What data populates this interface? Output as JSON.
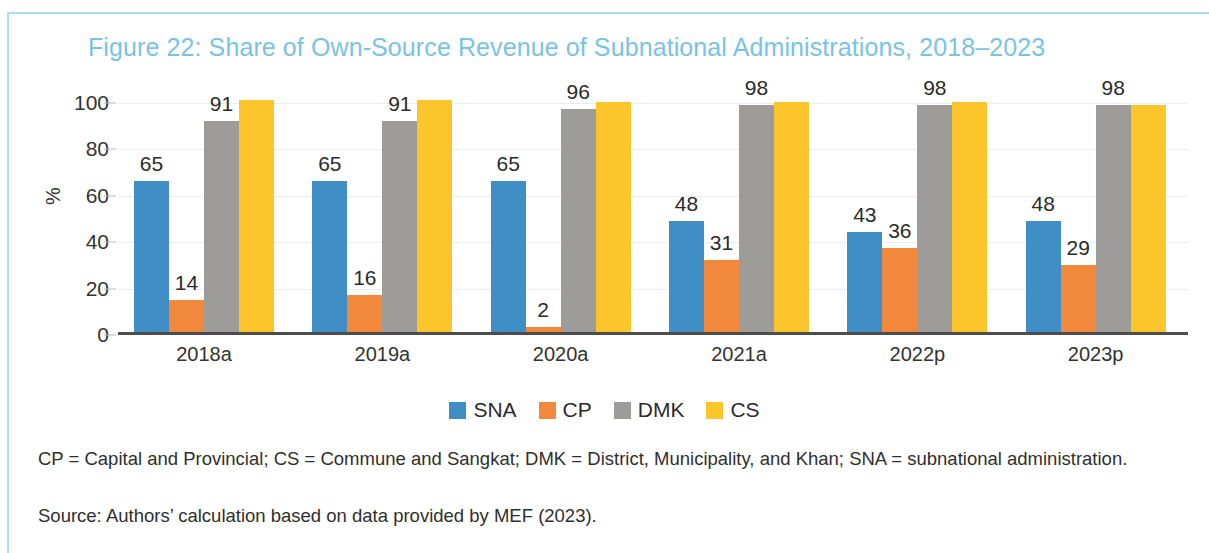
{
  "figure": {
    "title": "Figure 22: Share of Own-Source Revenue of Subnational Administrations, 2018–2023",
    "title_color": "#78c3e6",
    "notes": "CP = Capital and Provincial; CS = Commune and Sangkat; DMK = District, Municipality, and Khan; SNA = subnational administration.",
    "source": "Source: Authors’ calculation based on data provided by MEF (2023)."
  },
  "chart_data": {
    "type": "bar",
    "title": "Figure 22: Share of Own-Source Revenue of Subnational Administrations, 2018–2023",
    "xlabel": "",
    "ylabel": "%",
    "ylim": [
      0,
      100
    ],
    "yticks": [
      0,
      20,
      40,
      60,
      80,
      100
    ],
    "grid": true,
    "legend_position": "bottom",
    "categories": [
      "2018a",
      "2019a",
      "2020a",
      "2021a",
      "2022p",
      "2023p"
    ],
    "series": [
      {
        "name": "SNA",
        "color": "#3f8fc6",
        "values": [
          65,
          65,
          65,
          48,
          43,
          48
        ],
        "labels": [
          "65",
          "65",
          "65",
          "48",
          "43",
          "48"
        ],
        "show_labels": true
      },
      {
        "name": "CP",
        "color": "#f2883c",
        "values": [
          14,
          16,
          2,
          31,
          36,
          29
        ],
        "labels": [
          "14",
          "16",
          "2",
          "31",
          "36",
          "29"
        ],
        "show_labels": true
      },
      {
        "name": "DMK",
        "color": "#9d9c99",
        "values": [
          91,
          91,
          96,
          98,
          98,
          98
        ],
        "labels": [
          "91",
          "91",
          "96",
          "98",
          "98",
          "98"
        ],
        "show_labels": true
      },
      {
        "name": "CS",
        "color": "#fbc52b",
        "values": [
          100,
          100,
          99,
          99,
          99,
          98
        ],
        "labels": [
          "",
          "",
          "",
          "",
          "",
          ""
        ],
        "show_labels": false
      }
    ]
  }
}
